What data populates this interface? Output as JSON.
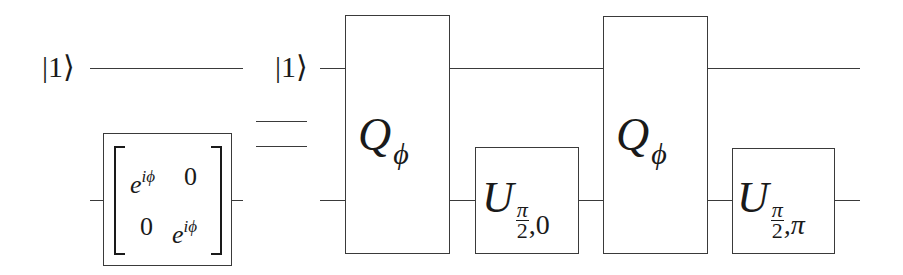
{
  "diagram": {
    "type": "quantum-circuit-identity",
    "lhs": {
      "input_state": "|1⟩",
      "gate": {
        "kind": "matrix",
        "rows": [
          [
            {
              "base": "e",
              "sup": "iϕ"
            },
            {
              "text": "0"
            }
          ],
          [
            {
              "text": "0"
            },
            {
              "base": "e",
              "sup": "iϕ"
            }
          ]
        ]
      }
    },
    "equals": "=",
    "rhs": {
      "input_state": "|1⟩",
      "gates": [
        {
          "id": "q1",
          "symbol": "Q",
          "subscript": "ϕ",
          "span": "two-qubit"
        },
        {
          "id": "u1",
          "symbol": "U",
          "sub_num": "π",
          "sub_den": "2",
          "sub_rest": ",0",
          "span": "bottom"
        },
        {
          "id": "q2",
          "symbol": "Q",
          "subscript": "ϕ",
          "span": "two-qubit"
        },
        {
          "id": "u2",
          "symbol": "U",
          "sub_num": "π",
          "sub_den": "2",
          "sub_rest": ",π",
          "span": "bottom"
        }
      ]
    },
    "colors": {
      "line": "#3a3a3a",
      "text": "#1a1a1a",
      "background": "#ffffff"
    }
  }
}
